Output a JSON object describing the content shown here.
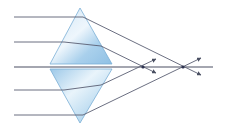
{
  "diagram": {
    "colors": {
      "ray": "#5a5f73",
      "axis": "#4a4f62",
      "prism_fill_light": "#e6f2fb",
      "prism_fill_dark": "#8fc0e4",
      "prism_edge": "#7aaed6",
      "focus_point": "#2e3350"
    },
    "axis": {
      "x1": 14,
      "y": 67,
      "x2": 213
    },
    "prisms": [
      {
        "name": "upper",
        "apex": [
          80,
          8
        ],
        "base_left": [
          50,
          64
        ],
        "base_right": [
          112,
          64
        ]
      },
      {
        "name": "lower",
        "apex": [
          80,
          123
        ],
        "base_left": [
          50,
          69
        ],
        "base_right": [
          112,
          69
        ]
      }
    ],
    "rays": [
      {
        "name": "ray-1",
        "points": [
          [
            14,
            17
          ],
          [
            83,
            17
          ],
          [
            201,
            75
          ]
        ],
        "arrow": true
      },
      {
        "name": "ray-2",
        "points": [
          [
            14,
            42
          ],
          [
            64,
            42
          ],
          [
            101,
            46
          ],
          [
            156,
            73
          ]
        ],
        "arrow": true
      },
      {
        "name": "ray-3",
        "points": [
          [
            14,
            90
          ],
          [
            64,
            90
          ],
          [
            101,
            85
          ],
          [
            156,
            59
          ]
        ],
        "arrow": true
      },
      {
        "name": "ray-4",
        "points": [
          [
            14,
            115
          ],
          [
            83,
            115
          ],
          [
            201,
            58
          ]
        ],
        "arrow": true
      }
    ],
    "focal_points": [
      {
        "name": "near-focus",
        "x": 143,
        "y": 67
      },
      {
        "name": "far-focus",
        "x": 183,
        "y": 67
      }
    ]
  }
}
